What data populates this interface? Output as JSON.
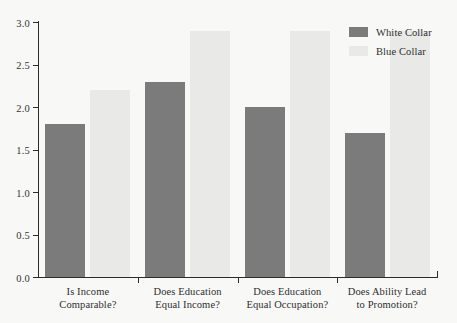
{
  "chart_data": {
    "type": "bar",
    "title": "",
    "xlabel": "",
    "ylabel": "",
    "ylim": [
      0.0,
      3.0
    ],
    "ytick_labels": [
      "3.0",
      "2.5",
      "2.0",
      "1.5",
      "1.0",
      "0.5",
      "0.0"
    ],
    "ytick_values": [
      3.0,
      2.5,
      2.0,
      1.5,
      1.0,
      0.5,
      0.0
    ],
    "grid": false,
    "legend_position": "top-right",
    "categories": [
      "Is Income\nComparable?",
      "Does Education\nEqual Income?",
      "Does Education\nEqual Occupation?",
      "Does Ability Lead\nto Promotion?"
    ],
    "category_lines": [
      [
        "Is Income",
        "Comparable?"
      ],
      [
        "Does Education",
        "Equal Income?"
      ],
      [
        "Does Education",
        "Equal Occupation?"
      ],
      [
        "Does Ability Lead",
        "to Promotion?"
      ]
    ],
    "series": [
      {
        "name": "White Collar",
        "color": "#7b7b7b",
        "values": [
          1.8,
          2.3,
          2.0,
          1.7
        ]
      },
      {
        "name": "Blue Collar",
        "color": "#e9e9e7",
        "values": [
          2.2,
          2.9,
          2.9,
          2.9
        ]
      }
    ]
  },
  "legend": {
    "items": [
      {
        "label": "White Collar",
        "color": "#7b7b7b"
      },
      {
        "label": "Blue Collar",
        "color": "#e9e9e7"
      }
    ]
  },
  "axis": {
    "y_labels": [
      "3.0",
      "2.5",
      "2.0",
      "1.5",
      "1.0",
      "0.5",
      "0.0"
    ]
  },
  "colors": {
    "background": "#f8f8f7",
    "axis": "#2c2c2c",
    "text": "#2e2e2e",
    "white_collar": "#7b7b7b",
    "blue_collar": "#e9e9e7"
  }
}
